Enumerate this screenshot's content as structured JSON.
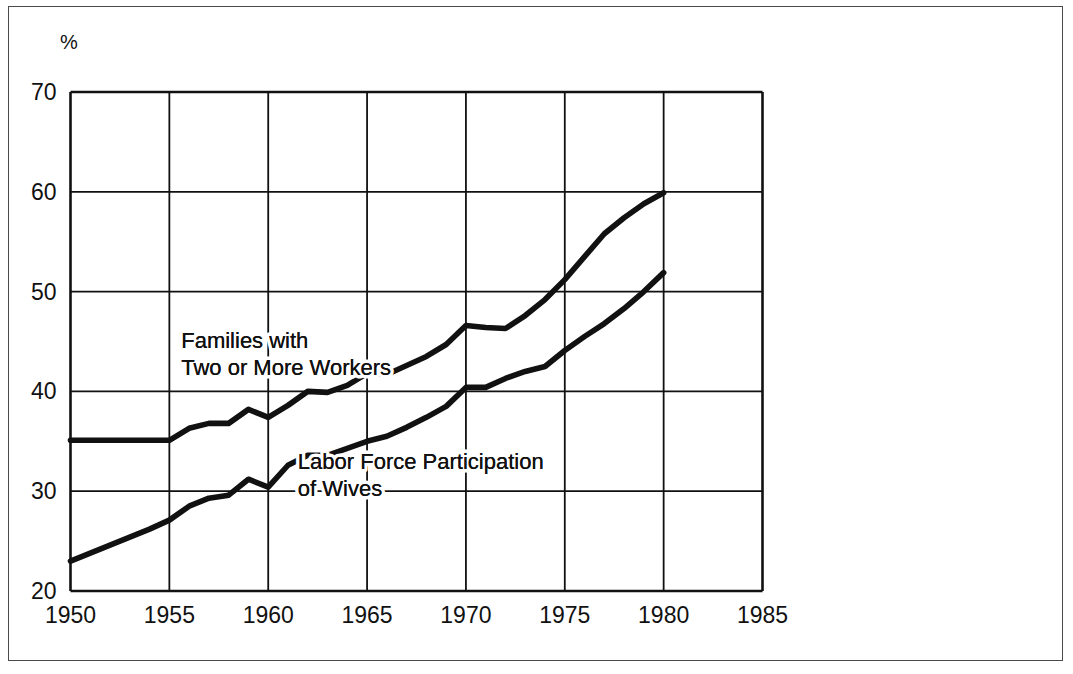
{
  "figure": {
    "unit_label": "%",
    "border_color": "#4a4a4a",
    "line_color": "#111111",
    "grid_color": "#111111",
    "background": "#ffffff"
  },
  "chart_data": {
    "type": "line",
    "title": "",
    "subtitle": "",
    "xlabel": "",
    "ylabel": "%",
    "xlim": [
      1950,
      1985
    ],
    "ylim": [
      20,
      70
    ],
    "xticks": [
      1950,
      1955,
      1960,
      1965,
      1970,
      1975,
      1980,
      1985
    ],
    "yticks": [
      20,
      30,
      40,
      50,
      60,
      70
    ],
    "xtick_labels": [
      "1950",
      "1955",
      "1960",
      "1965",
      "1970",
      "1975",
      "1980",
      "1985"
    ],
    "ytick_labels": [
      "20",
      "30",
      "40",
      "50",
      "60",
      "70"
    ],
    "grid": true,
    "legend": "inline-annotations",
    "annotations": [
      {
        "name": "families-label",
        "lines": [
          "Families with",
          "Two or More Workers"
        ],
        "x": 1955.6,
        "y": 44.3
      },
      {
        "name": "wives-label",
        "lines": [
          "Labor Force Participation",
          "of Wives"
        ],
        "x": 1961.5,
        "y": 32.2
      }
    ],
    "series": [
      {
        "name": "Families with Two or More Workers",
        "label": "Families with Two or More Workers",
        "color": "#111111",
        "x": [
          1950,
          1951,
          1952,
          1953,
          1954,
          1955,
          1956,
          1957,
          1958,
          1959,
          1960,
          1961,
          1962,
          1963,
          1964,
          1965,
          1966,
          1967,
          1968,
          1969,
          1970,
          1971,
          1972,
          1973,
          1974,
          1975,
          1976,
          1977,
          1978,
          1979,
          1980
        ],
        "values": [
          35.1,
          35.1,
          35.1,
          35.1,
          35.1,
          35.1,
          36.3,
          36.8,
          36.8,
          38.2,
          37.4,
          38.6,
          40.0,
          39.9,
          40.6,
          41.8,
          41.7,
          42.6,
          43.5,
          44.7,
          46.6,
          46.4,
          46.3,
          47.6,
          49.2,
          51.2,
          53.5,
          55.8,
          57.4,
          58.8,
          59.9
        ]
      },
      {
        "name": "Labor Force Participation of Wives",
        "label": "Labor Force Participation of Wives",
        "color": "#111111",
        "x": [
          1950,
          1951,
          1952,
          1953,
          1954,
          1955,
          1956,
          1957,
          1958,
          1959,
          1960,
          1961,
          1962,
          1963,
          1964,
          1965,
          1966,
          1967,
          1968,
          1969,
          1970,
          1971,
          1972,
          1973,
          1974,
          1975,
          1976,
          1977,
          1978,
          1979,
          1980
        ],
        "values": [
          23.0,
          23.8,
          24.6,
          25.4,
          26.2,
          27.1,
          28.5,
          29.3,
          29.6,
          31.2,
          30.4,
          32.6,
          33.6,
          33.6,
          34.3,
          35.0,
          35.5,
          36.4,
          37.4,
          38.5,
          40.4,
          40.4,
          41.3,
          42.0,
          42.5,
          44.1,
          45.5,
          46.8,
          48.3,
          50.0,
          51.9
        ]
      }
    ]
  }
}
